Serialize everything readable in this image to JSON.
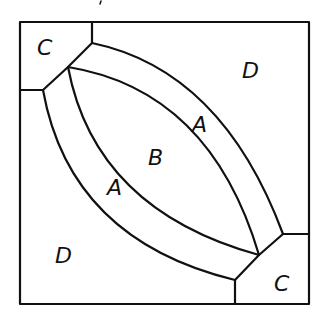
{
  "diagram": {
    "type": "quilt-block-pattern",
    "colors": {
      "line": "#111111",
      "background": "#ffffff"
    },
    "labels": {
      "corner_top_left": "C",
      "corner_bottom_right": "C",
      "background_top_right": "D",
      "background_bottom_left": "D",
      "arc_upper": "A",
      "arc_lower": "A",
      "center": "B"
    }
  }
}
